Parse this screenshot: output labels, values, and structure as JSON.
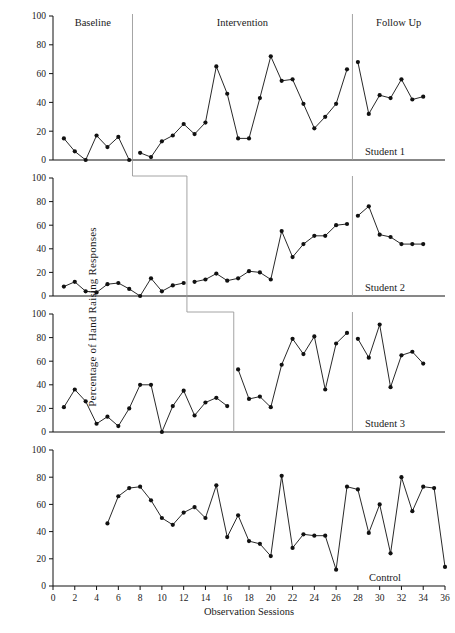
{
  "chart_data": {
    "type": "line",
    "title": "",
    "xlabel": "Observation Sessions",
    "ylabel": "Percentage of Hand Raising Responses",
    "xlim": [
      0,
      36
    ],
    "ylim": [
      0,
      100
    ],
    "xticks": [
      0,
      2,
      4,
      6,
      8,
      10,
      12,
      14,
      16,
      18,
      20,
      22,
      24,
      26,
      28,
      30,
      32,
      34,
      36
    ],
    "yticks": [
      0,
      20,
      40,
      60,
      80,
      100
    ],
    "grid": false,
    "legend": "none",
    "phase_labels": [
      "Baseline",
      "Intervention",
      "Follow Up"
    ],
    "panels": [
      {
        "name": "Student 1",
        "label": "Student 1",
        "phase_change_x": 7.3,
        "followup_change_x": 27.5,
        "x": [
          1,
          2,
          3,
          4,
          5,
          6,
          7,
          8,
          9,
          10,
          11,
          12,
          13,
          14,
          15,
          16,
          17,
          18,
          19,
          20,
          21,
          22,
          23,
          24,
          25,
          26,
          27,
          28,
          29,
          30,
          31,
          32,
          33,
          34
        ],
        "y": [
          15,
          6,
          0,
          17,
          9,
          16,
          0,
          5,
          2,
          13,
          17,
          25,
          18,
          26,
          65,
          46,
          15,
          15,
          43,
          72,
          55,
          56,
          39,
          22,
          30,
          39,
          63,
          68,
          32,
          45,
          43,
          56,
          42,
          44
        ]
      },
      {
        "name": "Student 2",
        "label": "Student 2",
        "phase_change_x": 12.3,
        "followup_change_x": 27.5,
        "x": [
          1,
          2,
          3,
          4,
          5,
          6,
          7,
          8,
          9,
          10,
          11,
          12,
          13,
          14,
          15,
          16,
          17,
          18,
          19,
          20,
          21,
          22,
          23,
          24,
          25,
          26,
          27,
          28,
          29,
          30,
          31,
          32,
          33,
          34
        ],
        "y": [
          8,
          12,
          4,
          3,
          10,
          11,
          6,
          0,
          15,
          4,
          9,
          11,
          12,
          14,
          19,
          13,
          15,
          21,
          20,
          14,
          55,
          33,
          44,
          51,
          51,
          60,
          61,
          68,
          76,
          52,
          50,
          44,
          44,
          44
        ]
      },
      {
        "name": "Student 3",
        "label": "Student 3",
        "phase_change_x": 16.6,
        "followup_change_x": 27.5,
        "x": [
          1,
          2,
          3,
          4,
          5,
          6,
          7,
          8,
          9,
          10,
          11,
          12,
          13,
          14,
          15,
          16,
          17,
          18,
          19,
          20,
          21,
          22,
          23,
          24,
          25,
          26,
          27,
          28,
          29,
          30,
          31,
          32,
          33,
          34
        ],
        "y": [
          21,
          36,
          26,
          7,
          13,
          5,
          20,
          40,
          40,
          0,
          22,
          35,
          14,
          25,
          29,
          22,
          53,
          28,
          30,
          21,
          57,
          79,
          66,
          81,
          36,
          75,
          84,
          79,
          63,
          91,
          38,
          65,
          68,
          58
        ]
      },
      {
        "name": "Control",
        "label": "Control",
        "phase_change_x": null,
        "followup_change_x": null,
        "x": [
          5,
          6,
          7,
          8,
          9,
          10,
          11,
          12,
          13,
          14,
          15,
          16,
          17,
          18,
          19,
          20,
          21,
          22,
          23,
          24,
          25,
          26,
          27,
          28,
          29,
          30,
          31,
          32,
          33,
          34,
          35,
          36
        ],
        "y": [
          46,
          66,
          72,
          73,
          63,
          50,
          45,
          54,
          58,
          50,
          74,
          36,
          52,
          33,
          31,
          22,
          81,
          28,
          38,
          37,
          37,
          12,
          73,
          71,
          39,
          60,
          24,
          80,
          55,
          73,
          72,
          14
        ]
      }
    ]
  }
}
